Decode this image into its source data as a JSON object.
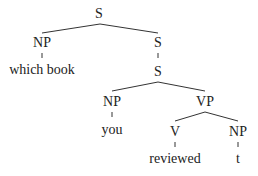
{
  "diagram": {
    "type": "syntax-tree",
    "nodes": {
      "root_s": "S",
      "np_left": "NP",
      "which_book": "which book",
      "s_upper": "S",
      "s_lower": "S",
      "np_mid": "NP",
      "you": "you",
      "vp": "VP",
      "v": "V",
      "reviewed": "reviewed",
      "np_right": "NP",
      "trace": "t"
    },
    "edges": [
      [
        "S",
        "NP"
      ],
      [
        "S",
        "S"
      ],
      [
        "NP",
        "which book"
      ],
      [
        "S",
        "S"
      ],
      [
        "S",
        "NP"
      ],
      [
        "S",
        "VP"
      ],
      [
        "NP",
        "you"
      ],
      [
        "VP",
        "V"
      ],
      [
        "VP",
        "NP"
      ],
      [
        "V",
        "reviewed"
      ],
      [
        "NP",
        "t"
      ]
    ],
    "colors": {
      "text": "#222222",
      "line": "#333333",
      "background": "#ffffff"
    }
  }
}
